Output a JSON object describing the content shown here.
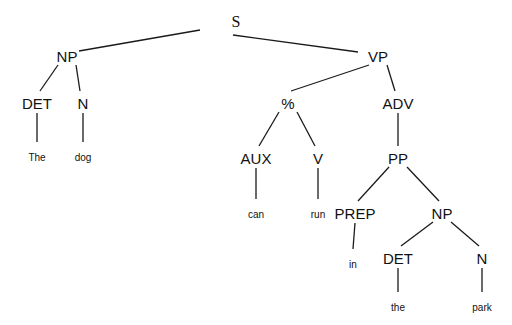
{
  "diagram": {
    "type": "syntax-tree",
    "nodes": [
      {
        "id": "s",
        "label": "S",
        "kind": "root"
      },
      {
        "id": "np1",
        "label": "NP",
        "kind": "category",
        "parent": "s"
      },
      {
        "id": "vp",
        "label": "VP",
        "kind": "category",
        "parent": "s"
      },
      {
        "id": "det1",
        "label": "DET",
        "kind": "category",
        "parent": "np1"
      },
      {
        "id": "n1",
        "label": "N",
        "kind": "category",
        "parent": "np1"
      },
      {
        "id": "w_the1",
        "label": "The",
        "kind": "word",
        "parent": "det1"
      },
      {
        "id": "w_dog",
        "label": "dog",
        "kind": "word",
        "parent": "n1"
      },
      {
        "id": "pct",
        "label": "%",
        "kind": "category",
        "parent": "vp"
      },
      {
        "id": "adv",
        "label": "ADV",
        "kind": "category",
        "parent": "vp"
      },
      {
        "id": "aux",
        "label": "AUX",
        "kind": "category",
        "parent": "pct"
      },
      {
        "id": "v",
        "label": "V",
        "kind": "category",
        "parent": "pct"
      },
      {
        "id": "w_can",
        "label": "can",
        "kind": "word",
        "parent": "aux"
      },
      {
        "id": "w_run",
        "label": "run",
        "kind": "word",
        "parent": "v"
      },
      {
        "id": "pp",
        "label": "PP",
        "kind": "category",
        "parent": "adv"
      },
      {
        "id": "prep",
        "label": "PREP",
        "kind": "category",
        "parent": "pp"
      },
      {
        "id": "np2",
        "label": "NP",
        "kind": "category",
        "parent": "pp"
      },
      {
        "id": "w_in",
        "label": "in",
        "kind": "word",
        "parent": "prep"
      },
      {
        "id": "det2",
        "label": "DET",
        "kind": "category",
        "parent": "np2"
      },
      {
        "id": "n2",
        "label": "N",
        "kind": "category",
        "parent": "np2"
      },
      {
        "id": "w_the2",
        "label": "the",
        "kind": "word",
        "parent": "det2"
      },
      {
        "id": "w_park",
        "label": "park",
        "kind": "word",
        "parent": "n2"
      }
    ]
  }
}
